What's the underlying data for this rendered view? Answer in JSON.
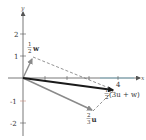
{
  "diagram": {
    "type": "vector-addition",
    "axes": {
      "x_label": "x",
      "y_label": "y",
      "x_ticks": [
        1,
        2,
        3,
        4
      ],
      "x_tick_labels_shown": [
        "4"
      ],
      "y_ticks": [
        2,
        1,
        -1,
        -2
      ],
      "y_tick_labels": [
        "2",
        "1",
        "-1",
        "-2"
      ]
    },
    "vectors": [
      {
        "name": "half-w",
        "label_frac": "1/2",
        "label_num": "1",
        "label_den": "2",
        "label_var": "w",
        "color": "#888888"
      },
      {
        "name": "two-thirds-u",
        "label_frac": "2/3",
        "label_num": "2",
        "label_den": "3",
        "label_var": "u",
        "color": "#888888"
      },
      {
        "name": "half-3u-plus-w",
        "label_frac": "1/2",
        "label_num": "1",
        "label_den": "2",
        "label_expr": "(3u + w)",
        "color": "#1a1a1a"
      }
    ],
    "colors": {
      "axis": "#555555",
      "result_vector": "#1a1a1a",
      "component_vectors": "#8a8a8a",
      "dashed": "#666666",
      "tick_accent": "#c98a7a"
    }
  }
}
